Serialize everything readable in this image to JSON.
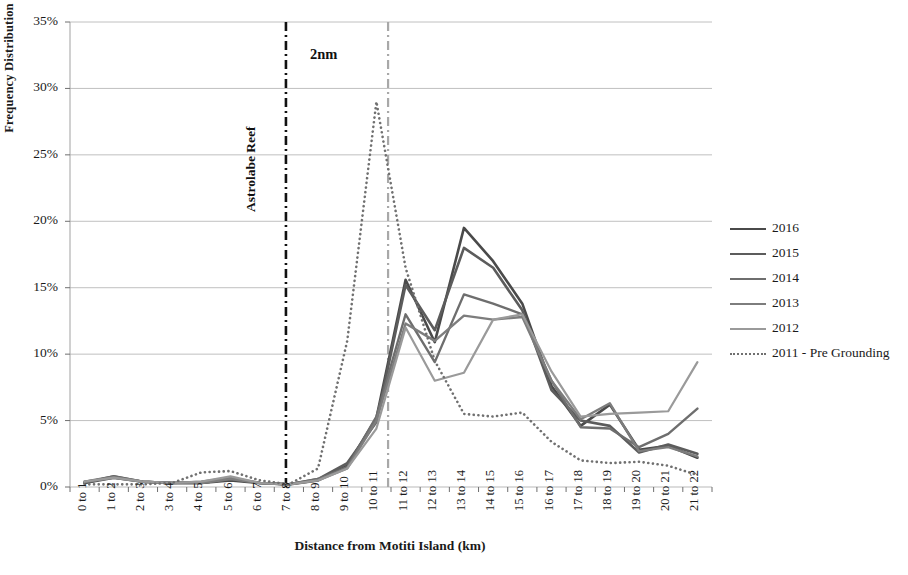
{
  "axes": {
    "y_title": "Frequency Distribution",
    "x_title": "Distance from Motiti Island (km)",
    "y_ticks": [
      "0%",
      "5%",
      "10%",
      "15%",
      "20%",
      "25%",
      "30%",
      "35%"
    ],
    "x_ticks": [
      "0 to 1",
      "1 to 2",
      "2 to 3",
      "3 to 4",
      "4 to 5",
      "5 to 6",
      "6 to 7",
      "7 to 8",
      "8 to 9",
      "9 to 10",
      "10 to 11",
      "11 to 12",
      "12 to 13",
      "13 to 14",
      "14 to 15",
      "15 to 16",
      "16 to 17",
      "17 to 18",
      "18 to 19",
      "19 to 20",
      "20 to 21",
      "21 to 22"
    ]
  },
  "annotations": {
    "two_nm": "2nm",
    "astrolabe_reef": "Astrolabe Reef"
  },
  "legend": {
    "position": "right",
    "items": [
      {
        "label": "2016",
        "color": "#4a4a4a",
        "style": "solid",
        "width": 2.6
      },
      {
        "label": "2015",
        "color": "#5c5c5c",
        "style": "solid",
        "width": 2.6
      },
      {
        "label": "2014",
        "color": "#6e6e6e",
        "style": "solid",
        "width": 2.4
      },
      {
        "label": "2013",
        "color": "#7d7d7d",
        "style": "solid",
        "width": 2.4
      },
      {
        "label": "2012",
        "color": "#9a9a9a",
        "style": "solid",
        "width": 2.2
      },
      {
        "label": "2011 - Pre Grounding",
        "color": "#707070",
        "style": "dotted",
        "width": 2.6
      }
    ]
  },
  "chart_data": {
    "type": "line",
    "title": "",
    "xlabel": "Distance from Motiti Island (km)",
    "ylabel": "Frequency Distribution",
    "ylim": [
      0,
      35
    ],
    "ytick_step": 5,
    "grid": true,
    "unit": "percent",
    "categories": [
      "0 to 1",
      "1 to 2",
      "2 to 3",
      "3 to 4",
      "4 to 5",
      "5 to 6",
      "6 to 7",
      "7 to 8",
      "8 to 9",
      "9 to 10",
      "10 to 11",
      "11 to 12",
      "12 to 13",
      "13 to 14",
      "14 to 15",
      "15 to 16",
      "16 to 17",
      "17 to 18",
      "18 to 19",
      "19 to 20",
      "20 to 21",
      "21 to 22"
    ],
    "series": [
      {
        "name": "2016",
        "color": "#4a4a4a",
        "style": "solid",
        "width": 2.6,
        "values": [
          0.3,
          0.7,
          0.4,
          0.3,
          0.3,
          0.5,
          0.3,
          0.2,
          0.5,
          1.6,
          5.2,
          15.6,
          10.9,
          19.5,
          17.0,
          13.8,
          7.6,
          4.6,
          6.2,
          2.8,
          3.1,
          2.2
        ]
      },
      {
        "name": "2015",
        "color": "#5c5c5c",
        "style": "solid",
        "width": 2.6,
        "values": [
          0.3,
          0.8,
          0.4,
          0.3,
          0.3,
          0.6,
          0.3,
          0.2,
          0.6,
          1.8,
          4.9,
          15.2,
          11.8,
          18.0,
          16.5,
          13.3,
          7.3,
          5.0,
          4.6,
          2.6,
          3.2,
          2.5
        ]
      },
      {
        "name": "2014",
        "color": "#6e6e6e",
        "style": "solid",
        "width": 2.4,
        "values": [
          0.4,
          0.8,
          0.4,
          0.3,
          0.4,
          0.7,
          0.3,
          0.2,
          0.6,
          1.5,
          5.3,
          13.0,
          9.4,
          14.5,
          13.8,
          13.0,
          8.0,
          4.5,
          4.4,
          3.0,
          4.0,
          5.9
        ]
      },
      {
        "name": "2013",
        "color": "#7d7d7d",
        "style": "solid",
        "width": 2.4,
        "values": [
          0.4,
          0.7,
          0.4,
          0.3,
          0.3,
          0.6,
          0.3,
          0.2,
          0.5,
          1.4,
          5.0,
          12.3,
          11.0,
          12.9,
          12.6,
          12.8,
          8.0,
          5.1,
          6.3,
          2.7,
          3.0,
          2.3
        ]
      },
      {
        "name": "2012",
        "color": "#9a9a9a",
        "style": "solid",
        "width": 2.2,
        "values": [
          0.4,
          0.7,
          0.4,
          0.3,
          0.4,
          0.8,
          0.3,
          0.2,
          0.5,
          1.4,
          4.4,
          12.0,
          8.0,
          8.6,
          12.6,
          13.0,
          8.7,
          5.3,
          5.5,
          5.6,
          5.7,
          9.4
        ]
      },
      {
        "name": "2011 - Pre Grounding",
        "color": "#707070",
        "style": "dotted",
        "width": 2.6,
        "values": [
          0.2,
          0.2,
          0.2,
          0.3,
          1.1,
          1.2,
          0.5,
          0.2,
          1.4,
          11.0,
          29.0,
          16.5,
          9.5,
          5.5,
          5.3,
          5.6,
          3.4,
          2.0,
          1.8,
          1.9,
          1.6,
          0.9
        ]
      }
    ],
    "reference_lines": [
      {
        "label": "Astrolabe Reef",
        "at_category_index": 6.9,
        "color": "#111111",
        "style": "dashdot",
        "width": 2.6
      },
      {
        "label": "",
        "at_category_index": 10.4,
        "color": "#a8a8a8",
        "style": "dashdot",
        "width": 2.2
      }
    ]
  }
}
